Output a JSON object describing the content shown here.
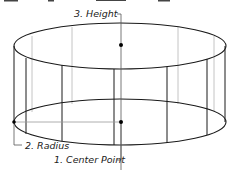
{
  "diagram": {
    "type": "cylinder-construction",
    "labels": {
      "height": "3. Height",
      "radius": "2. Radius",
      "center": "1. Center Point"
    },
    "colors": {
      "stroke": "#1a1a1a",
      "guide": "#9a9a9a",
      "text": "#222222"
    }
  }
}
